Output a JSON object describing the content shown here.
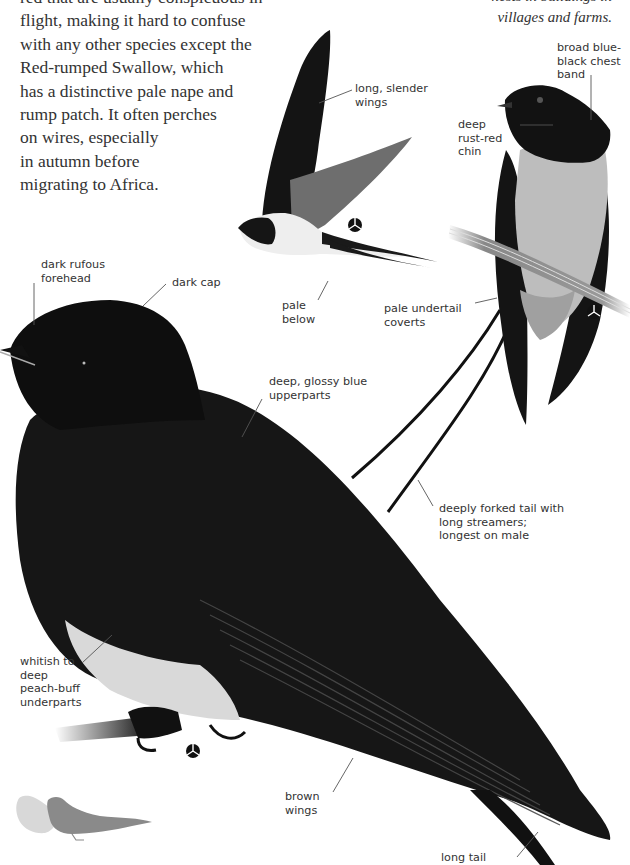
{
  "body_text": {
    "lines": [
      "red that are usually conspicuous in",
      "flight, making it hard to confuse",
      "with any other species except the",
      "Red-rumped Swallow, which",
      "has a distinctive pale nape and",
      "rump patch. It often perches",
      "on wires, especially",
      "in autumn before",
      "migrating to Africa."
    ]
  },
  "caption": {
    "lines": [
      "nests in buildings in",
      "villages and farms."
    ]
  },
  "illustrations": {
    "flight": {
      "labels": {
        "wings": [
          "long, slender",
          "wings"
        ],
        "below": [
          "pale",
          "below"
        ]
      },
      "sex_symbol": "male-symbol-icon"
    },
    "perched_front": {
      "labels": {
        "chest_band": [
          "broad blue-",
          "black chest",
          "band"
        ],
        "chin": [
          "deep",
          "rust-red",
          "chin"
        ],
        "undertail": [
          "pale undertail",
          "coverts"
        ],
        "tail": [
          "deeply forked tail with",
          "long streamers;",
          "longest on male"
        ]
      },
      "sex_symbol": "male-symbol-icon"
    },
    "perched_side": {
      "labels": {
        "forehead": [
          "dark rufous",
          "forehead"
        ],
        "cap": [
          "dark cap"
        ],
        "upperparts": [
          "deep, glossy blue",
          "upperparts"
        ],
        "underparts": [
          "whitish to",
          "deep",
          "peach-buff",
          "underparts"
        ],
        "wings": [
          "brown",
          "wings"
        ],
        "tail": [
          "long tail"
        ]
      },
      "sex_symbol": "male-symbol-icon"
    },
    "size_comparison": {
      "icon": "size-comparison-silhouette-icon"
    }
  },
  "colors": {
    "text": "#333333",
    "bird_dark": "#111111",
    "bird_mid": "#555555",
    "pale": "#e6e6e6",
    "silhouette_light": "#d8d8d8",
    "silhouette_dark": "#8a8a8a"
  }
}
